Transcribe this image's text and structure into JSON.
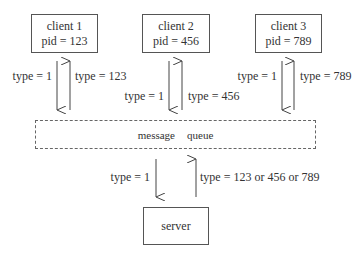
{
  "clients": [
    {
      "name": "client 1",
      "pid": "pid = 123",
      "down_label": "type = 1",
      "up_label": "type = 123"
    },
    {
      "name": "client 2",
      "pid": "pid = 456",
      "down_label": "type = 1",
      "up_label": "type = 456"
    },
    {
      "name": "client 3",
      "pid": "pid = 789",
      "down_label": "type = 1",
      "up_label": "type = 789"
    }
  ],
  "queue": {
    "word1": "message",
    "word2": "queue"
  },
  "server": {
    "name": "server",
    "down_label": "type = 1",
    "up_label": "type = 123 or 456 or 789"
  }
}
